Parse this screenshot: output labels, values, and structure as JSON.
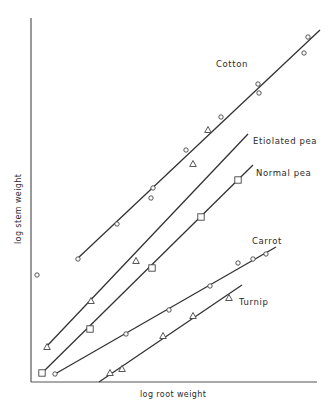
{
  "chart_data": {
    "type": "scatter",
    "title": "",
    "xlabel": "log root weight",
    "ylabel": "log stem weight",
    "grid": false,
    "legend": "inline labels at line ends",
    "axis_ticks": "none",
    "plot_area_px": {
      "x0": 31,
      "y0": 382,
      "x1": 317,
      "y1": 18
    },
    "series": [
      {
        "name": "Cotton",
        "marker": "circle",
        "label_pos": [
          216,
          64
        ],
        "fit_line": [
          [
            77,
            259
          ],
          [
            320,
            30
          ]
        ],
        "points": [
          [
            78,
            259
          ],
          [
            117,
            224
          ],
          [
            151,
            198
          ],
          [
            153,
            188
          ],
          [
            186,
            150
          ],
          [
            221,
            117
          ],
          [
            258,
            84
          ],
          [
            259,
            93
          ],
          [
            304,
            53
          ],
          [
            308,
            37
          ]
        ]
      },
      {
        "name": "Etiolated pea",
        "marker": "triangle",
        "label_pos": [
          255,
          142
        ],
        "fit_line": [
          [
            47,
            346
          ],
          [
            248,
            134
          ]
        ],
        "points": [
          [
            47,
            347
          ],
          [
            91,
            301
          ],
          [
            136,
            261
          ],
          [
            193,
            164
          ],
          [
            208,
            130
          ]
        ]
      },
      {
        "name": "Normal pea",
        "marker": "square",
        "label_pos": [
          257,
          174
        ],
        "fit_line": [
          [
            42,
            373
          ],
          [
            253,
            165
          ]
        ],
        "points": [
          [
            42,
            373
          ],
          [
            90,
            329
          ],
          [
            152,
            268
          ],
          [
            201,
            217
          ],
          [
            238,
            180
          ]
        ]
      },
      {
        "name": "Carrot",
        "marker": "circle",
        "label_pos": [
          252,
          244
        ],
        "fit_line": [
          [
            55,
            374
          ],
          [
            276,
            247
          ]
        ],
        "points": [
          [
            55,
            374
          ],
          [
            126,
            334
          ],
          [
            169,
            310
          ],
          [
            210,
            286
          ],
          [
            238,
            263
          ],
          [
            253,
            259
          ],
          [
            266,
            254
          ]
        ]
      },
      {
        "name": "Turnip",
        "marker": "triangle",
        "label_pos": [
          239,
          305
        ],
        "fit_line": [
          [
            99,
            382
          ],
          [
            242,
            285
          ]
        ],
        "points": [
          [
            110,
            373
          ],
          [
            122,
            369
          ],
          [
            163,
            336
          ],
          [
            193,
            316
          ],
          [
            229,
            298
          ]
        ]
      },
      {
        "name": "outlier",
        "marker": "circle",
        "points": [
          [
            37,
            275
          ]
        ]
      }
    ]
  },
  "axes": {
    "x_label": "log root weight",
    "y_label": "log stem weight"
  },
  "labels": {
    "cotton": "Cotton",
    "etiolated_pea": "Etiolated pea",
    "normal_pea": "Normal pea",
    "carrot": "Carrot",
    "turnip": "Turnip"
  }
}
